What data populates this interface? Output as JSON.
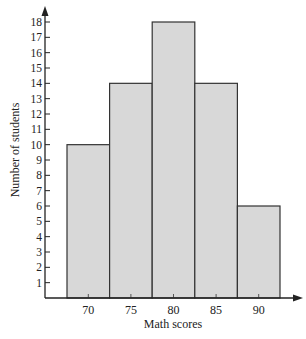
{
  "chart_data": {
    "type": "bar",
    "title": "",
    "xlabel": "Math scores",
    "ylabel": "Number of students",
    "categories": [
      "70",
      "75",
      "80",
      "85",
      "90"
    ],
    "values": [
      10,
      14,
      18,
      14,
      6
    ],
    "ylim": [
      0,
      18
    ],
    "yticks": [
      1,
      2,
      3,
      4,
      5,
      6,
      7,
      8,
      9,
      10,
      11,
      12,
      13,
      14,
      15,
      16,
      17,
      18
    ],
    "grid": false,
    "legend": null,
    "histogram": true,
    "colors": {
      "bar_fill": "#d8d8d8",
      "bar_stroke": "#333333",
      "axis": "#222222"
    }
  }
}
